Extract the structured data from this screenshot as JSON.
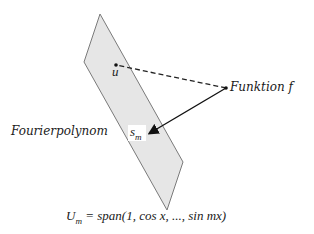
{
  "diagram": {
    "plane": {
      "fill": "#e6e6e6",
      "stroke": "#7a7a7a",
      "points": "100,14 183,162 167,210 84,62"
    },
    "point_u": {
      "label": "u",
      "x": 116,
      "y": 65
    },
    "point_f": {
      "label": "Funktion f",
      "x": 226,
      "y": 88
    },
    "point_s": {
      "label": "s",
      "sub": "m",
      "x": 148,
      "y": 134
    },
    "fourier_label": "Fourierpolynom",
    "span_label": {
      "U": "U",
      "U_sub": "m",
      "rest": " = span(1, cos x, ..., sin mx)"
    },
    "colors": {
      "line": "#222222",
      "text": "#1a1a1a"
    }
  }
}
